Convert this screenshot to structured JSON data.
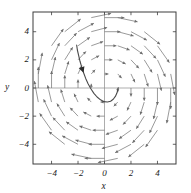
{
  "chart_data": {
    "type": "quiver",
    "title": "",
    "subtitle": "",
    "xlabel": "x",
    "ylabel": "y",
    "xlim": [
      -5.4,
      5.4
    ],
    "ylim": [
      -5.4,
      5.4
    ],
    "xticks": [
      -4,
      -2,
      0,
      2,
      4
    ],
    "yticks": [
      -4,
      -2,
      0,
      2,
      4
    ],
    "xtick_labels": [
      "−4",
      "−2",
      "0",
      "2",
      "4"
    ],
    "ytick_labels": [
      "−4",
      "−2",
      "0",
      "2",
      "4"
    ],
    "grid": false,
    "legend": null,
    "axes_style": "box-with-crosshair-axes",
    "field_description": "clockwise rotational direction field, arrow length grows with radius",
    "field_rule": {
      "dx": "y",
      "dy": "-x",
      "scale": 0.3,
      "sample_x": [
        -5,
        -4,
        -3,
        -2,
        -1,
        0,
        1,
        2,
        3,
        4,
        5
      ],
      "sample_y": [
        -5,
        -4,
        -3,
        -2,
        -1,
        0,
        1,
        2,
        3,
        4,
        5
      ],
      "radius_min": 0.9,
      "radius_max": 5.2
    },
    "solution_curve": {
      "name": "solution trajectory",
      "color": "#4a4a4a",
      "points": [
        [
          -2.1,
          3.05
        ],
        [
          -2.05,
          2.7
        ],
        [
          -1.95,
          2.3
        ],
        [
          -1.85,
          1.9
        ],
        [
          -1.72,
          1.48
        ],
        [
          -1.58,
          1.08
        ],
        [
          -1.42,
          0.68
        ],
        [
          -1.24,
          0.3
        ],
        [
          -1.03,
          -0.05
        ],
        [
          -0.8,
          -0.38
        ],
        [
          -0.56,
          -0.64
        ],
        [
          -0.3,
          -0.84
        ],
        [
          -0.04,
          -0.97
        ],
        [
          0.22,
          -1.0
        ],
        [
          0.46,
          -0.94
        ],
        [
          0.66,
          -0.8
        ],
        [
          0.82,
          -0.6
        ],
        [
          0.93,
          -0.38
        ],
        [
          1.0,
          -0.16
        ],
        [
          1.04,
          0.02
        ]
      ],
      "arrow_at": [
        -1.58,
        1.08
      ],
      "arrow_direction": "down-right along curve"
    },
    "colors": {
      "frame": "#3d3d3d",
      "axis": "#8a8a8a",
      "arrow": "#6e6e6e",
      "curve": "#4a4a4a",
      "text": "#1a1a1a",
      "background": "#ffffff"
    }
  },
  "geometry": {
    "frame_left": 33,
    "frame_right": 176,
    "frame_top": 12,
    "frame_bottom": 164,
    "origin_x": 104.5,
    "origin_y": 88
  },
  "labels": {
    "x_axis": "x",
    "y_axis": "y",
    "xticks": [
      "−4",
      "−2",
      "0",
      "2",
      "4"
    ],
    "yticks": [
      "4",
      "2",
      "0",
      "−2",
      "−4"
    ]
  }
}
